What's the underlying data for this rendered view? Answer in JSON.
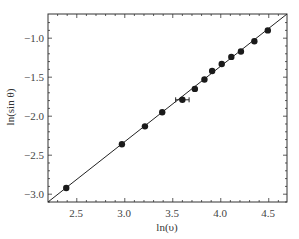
{
  "chart_data": {
    "type": "scatter",
    "title": "",
    "xlabel": "ln(υ)",
    "ylabel": "ln(sin θ)",
    "xlim": [
      2.2,
      4.69
    ],
    "ylim": [
      -3.1,
      -0.69
    ],
    "grid": false,
    "legend": null,
    "x_ticks": [
      "2.5",
      "3.0",
      "3.5",
      "4.0",
      "4.5"
    ],
    "y_ticks": [
      "-1.0",
      "-1.5",
      "-2.0",
      "-2.5",
      "-3.0"
    ],
    "series": [
      {
        "name": "data",
        "marker": "filled-circle",
        "x": [
          2.39,
          2.97,
          3.21,
          3.39,
          3.6,
          3.73,
          3.83,
          3.91,
          4.01,
          4.11,
          4.21,
          4.35,
          4.49
        ],
        "y": [
          -2.92,
          -2.36,
          -2.13,
          -1.95,
          -1.79,
          -1.65,
          -1.53,
          -1.42,
          -1.33,
          -1.24,
          -1.17,
          -1.04,
          -0.9
        ],
        "error_bar": {
          "index": 4,
          "x_err": 0.07,
          "y_err": 0.03
        }
      },
      {
        "name": "fit",
        "type": "line",
        "x": [
          2.2,
          4.69
        ],
        "y": [
          -3.1,
          -0.69
        ]
      }
    ]
  },
  "axes": {
    "x_label": "ln(υ)",
    "y_label": "ln(sin θ)",
    "x_tick_labels": [
      "2.5",
      "3.0",
      "3.5",
      "4.0",
      "4.5"
    ],
    "y_tick_labels": [
      "−1.0",
      "−1.5",
      "−2.0",
      "−2.5",
      "−3.0"
    ]
  }
}
